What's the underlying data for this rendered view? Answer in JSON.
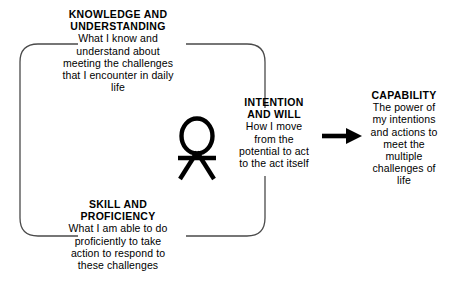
{
  "diagram": {
    "title_blocks": {
      "knowledge": {
        "heading": "KNOWLEDGE AND\nUNDERSTANDING",
        "body": "What I know and\nunderstand about\nmeeting the challenges\nthat I encounter in daily\nlife"
      },
      "skill": {
        "heading": "SKILL AND\nPROFICIENCY",
        "body": "What I am able to do\nproficiently to take\naction to respond to\nthese challenges"
      },
      "intention": {
        "heading": "INTENTION\nAND WILL",
        "body": "How I move\nfrom the\npotential to act\nto the act itself"
      },
      "capability": {
        "heading": "CAPABILITY",
        "body": "The power of\nmy intentions\nand actions to\nmeet the\nmultiple\nchallenges of\nlife"
      }
    },
    "figure": {
      "name": "person-stick-figure"
    },
    "arrow": {
      "name": "rightward-arrow"
    },
    "colors": {
      "ink": "#000000",
      "line": "#4a4a4a",
      "background": "#ffffff"
    }
  }
}
